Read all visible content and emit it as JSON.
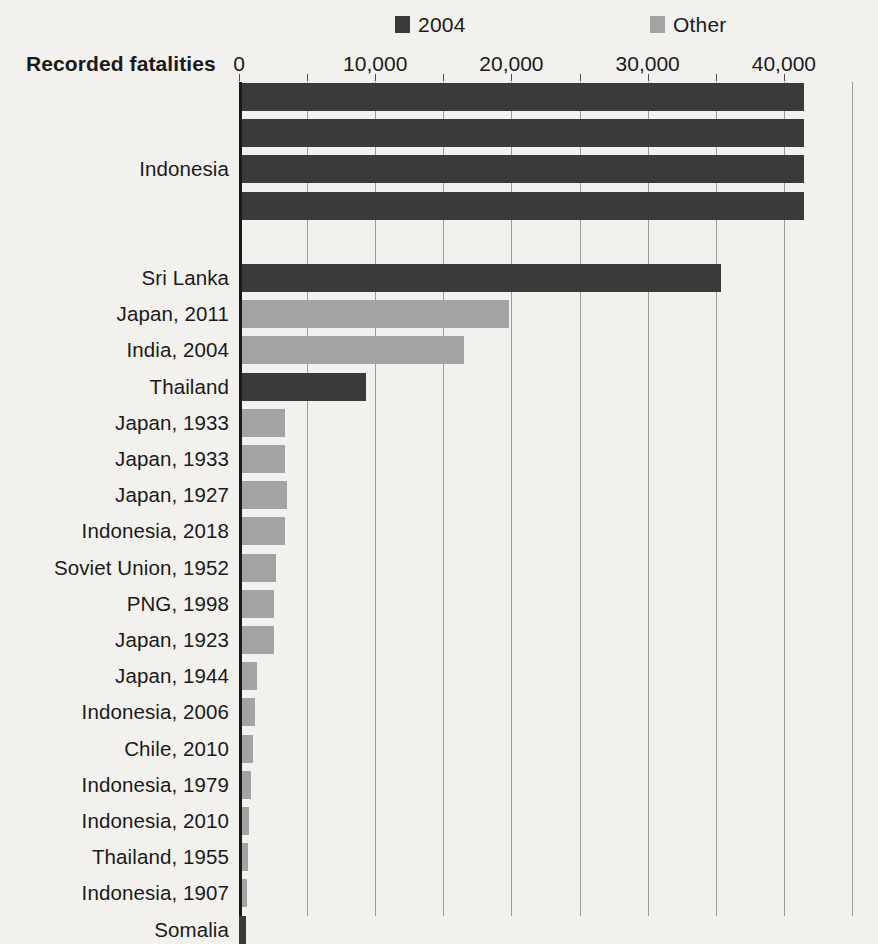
{
  "legend": {
    "entries": [
      {
        "label": "2004",
        "color": "#3a3a3a",
        "icon": "square-swatch-icon"
      },
      {
        "label": "Other",
        "color": "#a3a3a3",
        "icon": "square-swatch-icon"
      }
    ]
  },
  "axis": {
    "title": "Recorded fatalities",
    "tick_labels": [
      "0",
      "10,000",
      "20,000",
      "30,000",
      "40,000"
    ],
    "tick_values": [
      0,
      10000,
      20000,
      30000,
      40000
    ],
    "minor_tick_step": 5000,
    "max": 45000
  },
  "chart_data": {
    "type": "bar",
    "orientation": "horizontal",
    "title": "",
    "xlabel": "Recorded fatalities",
    "ylabel": "",
    "xlim": [
      0,
      45000
    ],
    "grid": "vertical",
    "legend_position": "top",
    "series_colors": {
      "2004": "#3a3a3a",
      "Other": "#a3a3a3"
    },
    "categories": [
      "Indonesia",
      "Indonesia",
      "Indonesia",
      "Indonesia",
      "Sri Lanka",
      "Japan, 2011",
      "India, 2004",
      "Thailand",
      "Japan, 1933",
      "Japan, 1933",
      "Japan, 1927",
      "Indonesia, 2018",
      "Soviet Union, 1952",
      "PNG, 1998",
      "Japan, 1923",
      "Japan, 1944",
      "Indonesia, 2006",
      "Chile, 2010",
      "Indonesia, 1979",
      "Indonesia, 2010",
      "Thailand, 1955",
      "Indonesia, 1907",
      "Somalia"
    ],
    "bars": [
      {
        "label": "Indonesia",
        "value": 41500,
        "group": "2004",
        "label_visible": false
      },
      {
        "label": "Indonesia",
        "value": 41500,
        "group": "2004",
        "label_visible": false
      },
      {
        "label": "Indonesia",
        "value": 41500,
        "group": "2004",
        "label_visible": true
      },
      {
        "label": "Indonesia",
        "value": 41500,
        "group": "2004",
        "label_visible": false
      },
      {
        "label": "",
        "value": 0,
        "group": "gap",
        "label_visible": false
      },
      {
        "label": "Sri Lanka",
        "value": 35400,
        "group": "2004",
        "label_visible": true
      },
      {
        "label": "Japan, 2011",
        "value": 19850,
        "group": "Other",
        "label_visible": true
      },
      {
        "label": "India, 2004",
        "value": 16550,
        "group": "Other",
        "label_visible": true
      },
      {
        "label": "Thailand",
        "value": 9300,
        "group": "2004",
        "label_visible": true
      },
      {
        "label": "Japan, 1933",
        "value": 3400,
        "group": "Other",
        "label_visible": true
      },
      {
        "label": "Japan, 1933",
        "value": 3400,
        "group": "Other",
        "label_visible": true
      },
      {
        "label": "Japan, 1927",
        "value": 3500,
        "group": "Other",
        "label_visible": true
      },
      {
        "label": "Indonesia, 2018",
        "value": 3350,
        "group": "Other",
        "label_visible": true
      },
      {
        "label": "Soviet Union, 1952",
        "value": 2750,
        "group": "Other",
        "label_visible": true
      },
      {
        "label": "PNG, 1998",
        "value": 2600,
        "group": "Other",
        "label_visible": true
      },
      {
        "label": "Japan, 1923",
        "value": 2550,
        "group": "Other",
        "label_visible": true
      },
      {
        "label": "Japan, 1944",
        "value": 1300,
        "group": "Other",
        "label_visible": true
      },
      {
        "label": "Indonesia, 2006",
        "value": 1150,
        "group": "Other",
        "label_visible": true
      },
      {
        "label": "Chile, 2010",
        "value": 1000,
        "group": "Other",
        "label_visible": true
      },
      {
        "label": "Indonesia, 1979",
        "value": 870,
        "group": "Other",
        "label_visible": true
      },
      {
        "label": "Indonesia, 2010",
        "value": 730,
        "group": "Other",
        "label_visible": true
      },
      {
        "label": "Thailand, 1955",
        "value": 650,
        "group": "Other",
        "label_visible": true
      },
      {
        "label": "Indonesia, 1907",
        "value": 580,
        "group": "Other",
        "label_visible": true
      },
      {
        "label": "Somalia",
        "value": 500,
        "group": "2004",
        "label_visible": true
      }
    ]
  }
}
